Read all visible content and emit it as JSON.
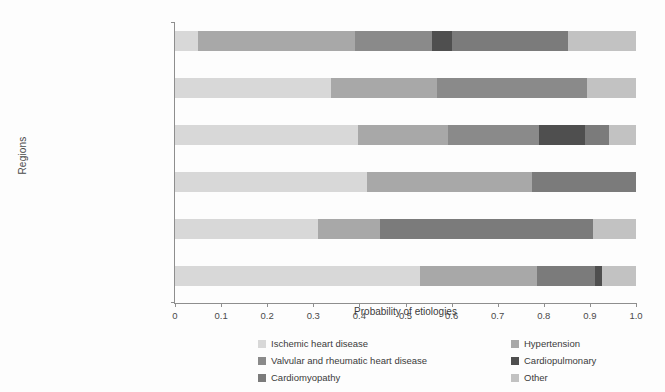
{
  "chart_data": {
    "type": "bar",
    "orientation": "horizontal",
    "stacked": true,
    "normalized": true,
    "title": "",
    "xlabel": "Probability of etiologies",
    "ylabel": "Regions",
    "xlim": [
      0,
      1
    ],
    "xticks": [
      "0",
      "0.1",
      "0.2",
      "0.3",
      "0.4",
      "0.5",
      "0.6",
      "0.7",
      "0.8",
      "0.9",
      "1.0"
    ],
    "xtick_values": [
      0,
      0.1,
      0.2,
      0.3,
      0.4,
      0.5,
      0.6,
      0.7,
      0.8,
      0.9,
      1.0
    ],
    "grid": false,
    "legend_position": "bottom",
    "categories": [
      "Sub-Saharan Africa",
      "Latin America and the Caribbean",
      "East Asia",
      "Eastern and Central Europe",
      "Asia Pacific, high income",
      "Western, high income"
    ],
    "series": [
      {
        "name": "Ischemic heart disease",
        "color": "#d8d8d8",
        "values": [
          0.05,
          0.34,
          0.4,
          0.42,
          0.31,
          0.53
        ]
      },
      {
        "name": "Hypertension",
        "color": "#a8a8a8",
        "values": [
          0.34,
          0.23,
          0.19,
          0.36,
          0.13,
          0.25
        ]
      },
      {
        "name": "Valvular and rheumatic heart disease",
        "color": "#8a8a8a",
        "values": [
          0.17,
          0.33,
          0.2,
          0.0,
          0.0,
          0.0
        ]
      },
      {
        "name": "Cardiopulmonary",
        "color": "#4f4f4f",
        "values": [
          0.04,
          0.0,
          0.1,
          0.0,
          0.0,
          0.015
        ]
      },
      {
        "name": "Cardiomyopathy",
        "color": "#7b7b7b",
        "values": [
          0.25,
          0.0,
          0.05,
          0.22,
          0.47,
          0.14
        ]
      },
      {
        "name": "Other",
        "color": "#c2c2c2",
        "values": [
          0.15,
          0.1,
          0.06,
          0.0,
          0.09,
          0.065
        ]
      }
    ],
    "bars": [
      {
        "category": "Sub-Saharan Africa",
        "segments": [
          {
            "series": "Ischemic heart disease",
            "start": 0.0,
            "end": 0.05
          },
          {
            "series": "Hypertension",
            "start": 0.05,
            "end": 0.39
          },
          {
            "series": "Valvular and rheumatic heart disease",
            "start": 0.39,
            "end": 0.557
          },
          {
            "series": "Cardiopulmonary",
            "start": 0.557,
            "end": 0.6
          },
          {
            "series": "Cardiomyopathy",
            "start": 0.6,
            "end": 0.852
          },
          {
            "series": "Other",
            "start": 0.852,
            "end": 1.0
          }
        ]
      },
      {
        "category": "Latin America and the Caribbean",
        "segments": [
          {
            "series": "Ischemic heart disease",
            "start": 0.0,
            "end": 0.338
          },
          {
            "series": "Hypertension",
            "start": 0.338,
            "end": 0.568
          },
          {
            "series": "Valvular and rheumatic heart disease",
            "start": 0.568,
            "end": 0.893
          },
          {
            "series": "Other",
            "start": 0.893,
            "end": 1.0
          }
        ]
      },
      {
        "category": "East Asia",
        "segments": [
          {
            "series": "Ischemic heart disease",
            "start": 0.0,
            "end": 0.397
          },
          {
            "series": "Hypertension",
            "start": 0.397,
            "end": 0.592
          },
          {
            "series": "Valvular and rheumatic heart disease",
            "start": 0.592,
            "end": 0.79
          },
          {
            "series": "Cardiopulmonary",
            "start": 0.79,
            "end": 0.889
          },
          {
            "series": "Cardiomyopathy",
            "start": 0.889,
            "end": 0.941
          },
          {
            "series": "Other",
            "start": 0.941,
            "end": 1.0
          }
        ]
      },
      {
        "category": "Eastern and Central Europe",
        "segments": [
          {
            "series": "Ischemic heart disease",
            "start": 0.0,
            "end": 0.416
          },
          {
            "series": "Hypertension",
            "start": 0.416,
            "end": 0.774
          },
          {
            "series": "Cardiomyopathy",
            "start": 0.774,
            "end": 1.0
          }
        ]
      },
      {
        "category": "Asia Pacific, high income",
        "segments": [
          {
            "series": "Ischemic heart disease",
            "start": 0.0,
            "end": 0.31
          },
          {
            "series": "Hypertension",
            "start": 0.31,
            "end": 0.445
          },
          {
            "series": "Cardiomyopathy",
            "start": 0.445,
            "end": 0.906
          },
          {
            "series": "Other",
            "start": 0.906,
            "end": 1.0
          }
        ]
      },
      {
        "category": "Western, high income",
        "segments": [
          {
            "series": "Ischemic heart disease",
            "start": 0.0,
            "end": 0.531
          },
          {
            "series": "Hypertension",
            "start": 0.531,
            "end": 0.785
          },
          {
            "series": "Cardiomyopathy",
            "start": 0.785,
            "end": 0.912
          },
          {
            "series": "Cardiopulmonary",
            "start": 0.912,
            "end": 0.927
          },
          {
            "series": "Other",
            "start": 0.927,
            "end": 1.0
          }
        ]
      }
    ]
  },
  "legend": {
    "entries": [
      {
        "label": "Ischemic heart disease",
        "color": "#d8d8d8"
      },
      {
        "label": "Hypertension",
        "color": "#a8a8a8"
      },
      {
        "label": "Valvular and rheumatic heart disease",
        "color": "#8a8a8a"
      },
      {
        "label": "Cardiopulmonary",
        "color": "#4f4f4f"
      },
      {
        "label": "Cardiomyopathy",
        "color": "#7b7b7b"
      },
      {
        "label": "Other",
        "color": "#c2c2c2"
      }
    ]
  },
  "axes": {
    "x_title": "Probability of etiologies",
    "y_title": "Regions"
  }
}
